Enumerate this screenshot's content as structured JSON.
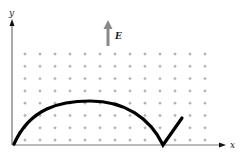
{
  "figure": {
    "axes": {
      "x_label": "x",
      "y_label": "y"
    },
    "field": {
      "label": "E",
      "direction": "up",
      "arrow_color": "#8a8a8a"
    },
    "magnetic_field_marker": "dot",
    "grid": {
      "columns": 13,
      "rows": 8
    },
    "trajectory": {
      "description": "cycloid-like path with cusp on x-axis",
      "color": "#000000"
    }
  }
}
